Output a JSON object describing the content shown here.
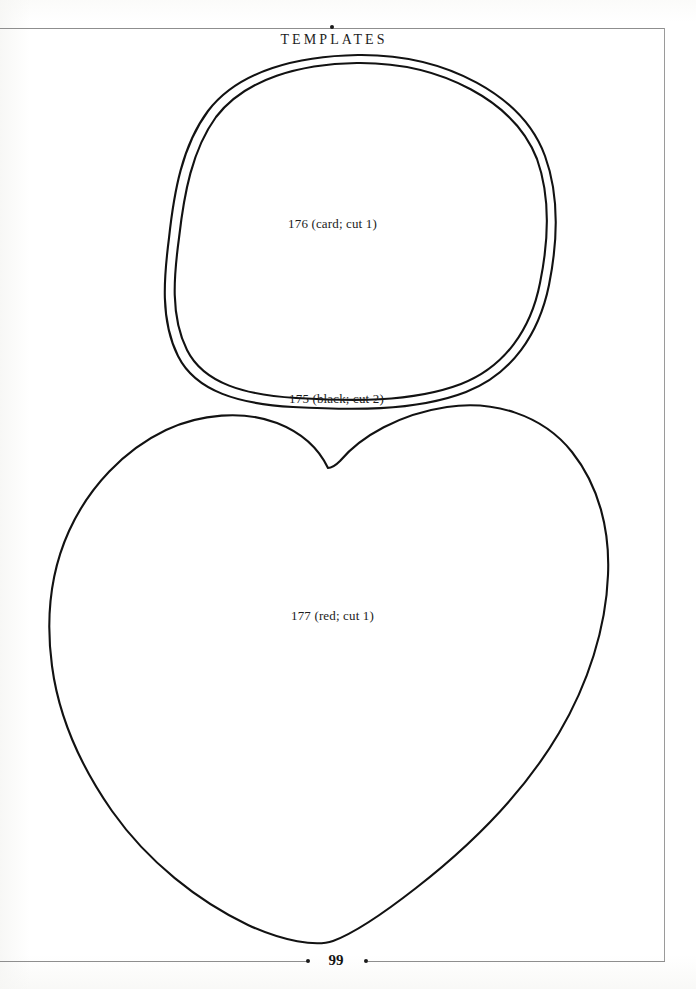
{
  "page": {
    "header_title": "TEMPLATES",
    "page_number": "99",
    "background_color": "#ffffff",
    "ink_color": "#141414",
    "rule_color": "#8e8e8e"
  },
  "templates": [
    {
      "id": "oval-outer",
      "shape": "oval",
      "label": "176 (card; cut 1)",
      "number": "176",
      "material": "card",
      "cut_count": "cut 1"
    },
    {
      "id": "oval-inner",
      "shape": "oval",
      "label": "175 (black; cut 2)",
      "number": "175",
      "material": "black",
      "cut_count": "cut 2"
    },
    {
      "id": "heart",
      "shape": "heart",
      "label": "177 (red; cut 1)",
      "number": "177",
      "material": "red",
      "cut_count": "cut 1"
    }
  ],
  "icons": {
    "header_dot": "bullet-dot-icon",
    "footer_dot_left": "bullet-dot-icon",
    "footer_dot_right": "bullet-dot-icon"
  }
}
